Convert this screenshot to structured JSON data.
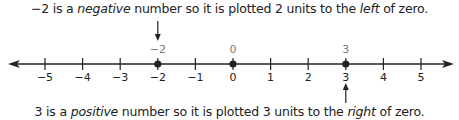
{
  "captions": {
    "top": {
      "pre": "−2 is a ",
      "em1": "negative",
      "mid": " number so it is plotted 2 units to the ",
      "em2": "left",
      "post": " of zero."
    },
    "bottom": {
      "pre": "3 is a ",
      "em1": "positive",
      "mid": " number so it is plotted 3 units to the ",
      "em2": "right",
      "post": " of zero."
    }
  },
  "number_line": {
    "min": -5,
    "max": 5,
    "ticks": [
      "−5",
      "−4",
      "−3",
      "−2",
      "−1",
      "0",
      "1",
      "2",
      "3",
      "4",
      "5"
    ],
    "plotted_points": [
      {
        "value": -2,
        "label": "−2",
        "arrow": "down"
      },
      {
        "value": 0,
        "label": "0",
        "arrow": "none"
      },
      {
        "value": 3,
        "label": "3",
        "arrow": "up"
      }
    ],
    "line_color": "#222222",
    "point_label_color": "#777777"
  }
}
